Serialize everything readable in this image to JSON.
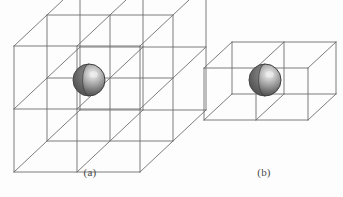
{
  "figure": {
    "background_color": "#fdfdfd",
    "line_color": "#6e6e6e",
    "line_width": 0.9,
    "sphere": {
      "fill_dark": "#4f4f4f",
      "fill_mid": "#8e8e8e",
      "fill_light": "#d8d8d8",
      "highlight": "#e8e8e8",
      "edge_color": "#3d3d3d",
      "radius": 16
    },
    "panels": [
      {
        "id": "panel-a",
        "caption": "(a)",
        "kind": "wireframe-lattice",
        "cells": [
          2,
          2,
          2
        ],
        "cell_size": 63,
        "depth_dx": 33,
        "depth_dy": -31,
        "origin": [
          14,
          172
        ],
        "sphere_center": [
          89,
          80
        ]
      },
      {
        "id": "panel-b",
        "caption": "(b)",
        "kind": "wireframe-lattice",
        "cells": [
          2,
          1,
          1
        ],
        "cell_size": 52,
        "depth_dx": 28,
        "depth_dy": -26,
        "origin": [
          204,
          120
        ],
        "sphere_center": [
          265,
          80
        ]
      }
    ]
  },
  "captions": {
    "a": "(a)",
    "b": "(b)"
  }
}
